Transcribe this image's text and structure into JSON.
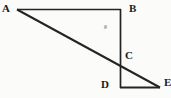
{
  "figure": {
    "background_color": "#fbfbfa",
    "stroke_color": "#242424",
    "label_color": "#1a1a1a",
    "lines": [
      {
        "name": "segment-AB",
        "x1": 17,
        "y1": 9.5,
        "x2": 121,
        "y2": 9.5,
        "width": 1.7
      },
      {
        "name": "segment-BD",
        "x1": 120.5,
        "y1": 9,
        "x2": 120.5,
        "y2": 88,
        "width": 1.7
      },
      {
        "name": "segment-AE",
        "x1": 17,
        "y1": 9.5,
        "x2": 160,
        "y2": 87.5,
        "width": 2.0
      },
      {
        "name": "segment-DE",
        "x1": 120,
        "y1": 87.5,
        "x2": 160,
        "y2": 87.5,
        "width": 2.0
      }
    ],
    "labels": [
      {
        "text": "A",
        "x": 2,
        "y": 3
      },
      {
        "text": "B",
        "x": 129,
        "y": 3
      },
      {
        "text": "C",
        "x": 125,
        "y": 50
      },
      {
        "text": "D",
        "x": 101,
        "y": 79
      },
      {
        "text": "E",
        "x": 164,
        "y": 77
      }
    ],
    "stray_mark": {
      "x": 104,
      "y": 25,
      "color": "#b9b9b5"
    }
  }
}
